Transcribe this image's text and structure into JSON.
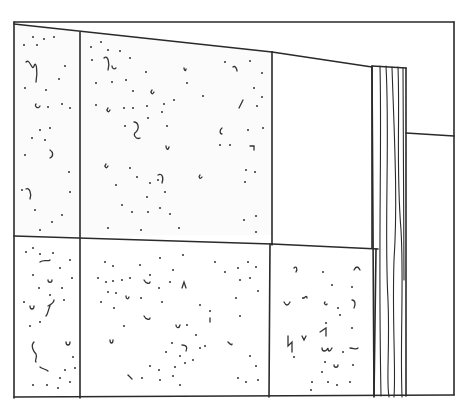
{
  "image": {
    "description": "Line drawing of a wall built from speckled (aggregate-textured) rectangular panels, with an upright wood-grain post and a blank plain area on the right",
    "style": "black ink line illustration on white",
    "colors": {
      "ink": "#2a2a2a",
      "background": "#ffffff"
    },
    "elements": {
      "outer_frame": "rectangular border",
      "panels": [
        {
          "name": "top-left-narrow-panel",
          "texture": "speckled"
        },
        {
          "name": "top-center-panel",
          "texture": "speckled"
        },
        {
          "name": "top-right-blank-panel",
          "texture": "plain"
        },
        {
          "name": "bottom-left-narrow-panel",
          "texture": "speckled"
        },
        {
          "name": "bottom-center-panel",
          "texture": "speckled"
        },
        {
          "name": "bottom-right-panel",
          "texture": "speckled"
        }
      ],
      "post": {
        "name": "wood-post",
        "texture": "wood grain"
      },
      "right_area": "plain wall with horizontal line"
    }
  }
}
